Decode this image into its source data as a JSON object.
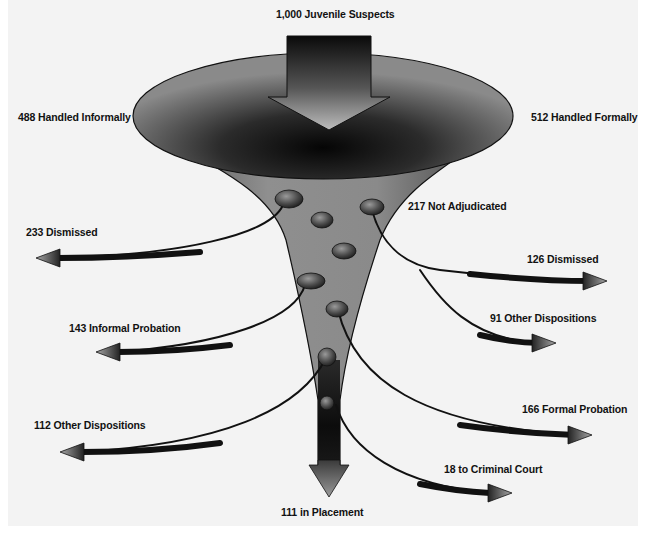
{
  "diagram": {
    "title": "1,000 Juvenile Suspects",
    "colors": {
      "background": "#f3f3f3",
      "funnel_dark": "#111111",
      "funnel_mid": "#6e6e6e",
      "funnel_light": "#9a9a9a",
      "text": "#111111"
    },
    "top_split": {
      "left": "488 Handled Informally",
      "right": "512 Handled Formally"
    },
    "outcomes": {
      "informal_dismissed": "233 Dismissed",
      "informal_probation": "143 Informal Probation",
      "informal_other": "112 Other Dispositions",
      "not_adjudicated": "217 Not Adjudicated",
      "not_adj_dismissed": "126 Dismissed",
      "not_adj_other": "91 Other Dispositions",
      "formal_probation": "166 Formal Probation",
      "criminal_court": "18 to Criminal Court",
      "placement": "111 in Placement"
    },
    "nodes": [
      {
        "label": "Juvenile Suspects",
        "value": 1000
      },
      {
        "label": "Handled Informally",
        "value": 488
      },
      {
        "label": "Handled Formally",
        "value": 512
      },
      {
        "label": "Dismissed (informal)",
        "value": 233
      },
      {
        "label": "Informal Probation",
        "value": 143
      },
      {
        "label": "Other Dispositions (informal)",
        "value": 112
      },
      {
        "label": "Not Adjudicated",
        "value": 217
      },
      {
        "label": "Dismissed (not adjudicated)",
        "value": 126
      },
      {
        "label": "Other Dispositions (not adjudicated)",
        "value": 91
      },
      {
        "label": "Formal Probation",
        "value": 166
      },
      {
        "label": "to Criminal Court",
        "value": 18
      },
      {
        "label": "in Placement",
        "value": 111
      }
    ]
  }
}
